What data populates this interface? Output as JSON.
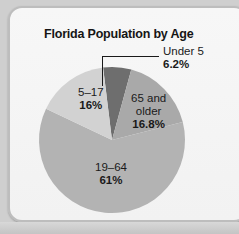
{
  "chart_data": {
    "type": "pie",
    "title": "Florida Population by Age",
    "categories": [
      "Under 5",
      "65 and older",
      "19–64",
      "5–17"
    ],
    "values": [
      6.2,
      16.8,
      61,
      16
    ],
    "unit": "%",
    "labels": [
      {
        "category": "Under 5",
        "value_label": "6.2%"
      },
      {
        "category": "65 and older",
        "value_label": "16.8%"
      },
      {
        "category": "19–64",
        "value_label": "61%"
      },
      {
        "category": "5–17",
        "value_label": "16%"
      }
    ],
    "colors": [
      "#6e6e6e",
      "#a9a9a9",
      "#b3b3b3",
      "#d2d2d2"
    ],
    "legend": "none (inline labels)",
    "grid": false
  },
  "labels": {
    "under5_name": "Under 5",
    "under5_pct": "6.2%",
    "over65_line1": "65 and",
    "over65_line2": "older",
    "over65_pct": "16.8%",
    "adult_name": "19–64",
    "adult_pct": "61%",
    "youth_name": "5–17",
    "youth_pct": "16%"
  }
}
